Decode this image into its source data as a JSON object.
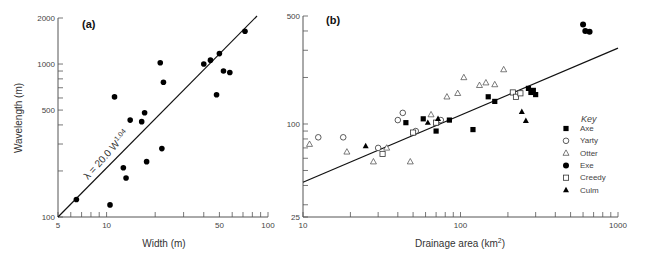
{
  "chart_data": [
    {
      "type": "scatter",
      "panel_label": "(a)",
      "xlabel": "Width (m)",
      "ylabel": "Wavelength (m)",
      "xscale": "log",
      "yscale": "log",
      "xlim": [
        5,
        100
      ],
      "ylim": [
        100,
        2000
      ],
      "xticks": [
        "5",
        "10",
        "50",
        "100"
      ],
      "yticks": [
        "100",
        "500",
        "1000",
        "2000"
      ],
      "annotation": "λ = 20.0 W^1.04",
      "fit_line": {
        "equation": "λ = 20.0 W^1.04",
        "x": [
          5,
          100
        ],
        "y": [
          107,
          2400
        ]
      },
      "points": [
        {
          "x": 6.5,
          "y": 130
        },
        {
          "x": 10.5,
          "y": 120
        },
        {
          "x": 11.2,
          "y": 610
        },
        {
          "x": 12.7,
          "y": 210
        },
        {
          "x": 13.2,
          "y": 180
        },
        {
          "x": 14.0,
          "y": 430
        },
        {
          "x": 16.5,
          "y": 420
        },
        {
          "x": 17.2,
          "y": 480
        },
        {
          "x": 17.7,
          "y": 230
        },
        {
          "x": 21.5,
          "y": 1020
        },
        {
          "x": 22.0,
          "y": 280
        },
        {
          "x": 22.5,
          "y": 760
        },
        {
          "x": 40.0,
          "y": 1000
        },
        {
          "x": 44.0,
          "y": 1060
        },
        {
          "x": 48.0,
          "y": 630
        },
        {
          "x": 50.0,
          "y": 1170
        },
        {
          "x": 53.0,
          "y": 900
        },
        {
          "x": 58.0,
          "y": 880
        },
        {
          "x": 72.0,
          "y": 1640
        }
      ]
    },
    {
      "type": "scatter",
      "panel_label": "(b)",
      "xlabel": "Drainage area (km²)",
      "ylabel": "",
      "xscale": "log",
      "yscale": "log",
      "xlim": [
        10,
        1000
      ],
      "ylim": [
        25,
        500
      ],
      "xticks": [
        "10",
        "100",
        "1000"
      ],
      "yticks": [
        "25",
        "100",
        "500"
      ],
      "legend_title": "Key",
      "legend_position": "right",
      "fit_line": {
        "x": [
          10,
          1000
        ],
        "y": [
          42,
          310
        ]
      },
      "series": [
        {
          "name": "Axe",
          "marker": "filled-square",
          "points": [
            {
              "x": 45,
              "y": 102
            },
            {
              "x": 58,
              "y": 108
            },
            {
              "x": 70,
              "y": 90
            },
            {
              "x": 85,
              "y": 106
            },
            {
              "x": 120,
              "y": 92
            },
            {
              "x": 150,
              "y": 150
            },
            {
              "x": 165,
              "y": 140
            },
            {
              "x": 270,
              "y": 170
            },
            {
              "x": 280,
              "y": 160
            },
            {
              "x": 300,
              "y": 155
            },
            {
              "x": 290,
              "y": 165
            }
          ]
        },
        {
          "name": "Yarty",
          "marker": "open-circle",
          "points": [
            {
              "x": 12.5,
              "y": 82
            },
            {
              "x": 18,
              "y": 82
            },
            {
              "x": 30,
              "y": 70
            },
            {
              "x": 40,
              "y": 106
            },
            {
              "x": 43,
              "y": 118
            },
            {
              "x": 52,
              "y": 90
            },
            {
              "x": 75,
              "y": 106
            }
          ]
        },
        {
          "name": "Otter",
          "marker": "open-triangle",
          "points": [
            {
              "x": 11,
              "y": 74
            },
            {
              "x": 19,
              "y": 66
            },
            {
              "x": 28,
              "y": 57
            },
            {
              "x": 34,
              "y": 70
            },
            {
              "x": 48,
              "y": 57
            },
            {
              "x": 65,
              "y": 115
            },
            {
              "x": 82,
              "y": 150
            },
            {
              "x": 96,
              "y": 158
            },
            {
              "x": 105,
              "y": 200
            },
            {
              "x": 132,
              "y": 178
            },
            {
              "x": 145,
              "y": 185
            },
            {
              "x": 165,
              "y": 180
            },
            {
              "x": 188,
              "y": 225
            }
          ]
        },
        {
          "name": "Exe",
          "marker": "filled-circle",
          "points": [
            {
              "x": 600,
              "y": 440
            },
            {
              "x": 620,
              "y": 400
            },
            {
              "x": 660,
              "y": 395
            }
          ]
        },
        {
          "name": "Creedy",
          "marker": "open-square",
          "points": [
            {
              "x": 32,
              "y": 64
            },
            {
              "x": 50,
              "y": 88
            },
            {
              "x": 70,
              "y": 102
            },
            {
              "x": 215,
              "y": 160
            },
            {
              "x": 225,
              "y": 150
            },
            {
              "x": 240,
              "y": 158
            }
          ]
        },
        {
          "name": "Culm",
          "marker": "filled-triangle",
          "points": [
            {
              "x": 25,
              "y": 72
            },
            {
              "x": 62,
              "y": 102
            },
            {
              "x": 72,
              "y": 108
            },
            {
              "x": 245,
              "y": 120
            },
            {
              "x": 260,
              "y": 105
            }
          ]
        }
      ]
    }
  ],
  "labels": {
    "a": {
      "panel": "(a)",
      "xlabel": "Width (m)",
      "ylabel": "Wavelength (m)",
      "eq": "λ = 20.0 W",
      "eq_exp": "1.04"
    },
    "b": {
      "panel": "(b)",
      "xlabel": "Drainage area (km",
      "xlabel_sup": "2",
      "xlabel_end": ")",
      "key": "Key"
    }
  },
  "legend": [
    "Axe",
    "Yarty",
    "Otter",
    "Exe",
    "Creedy",
    "Culm"
  ]
}
